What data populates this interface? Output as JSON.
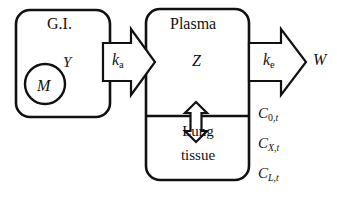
{
  "diagram": {
    "stroke_color": "#111111",
    "fill_color": "#ffffff",
    "compartments": [
      {
        "id": "gi",
        "name": "G.I. compartment",
        "label": "G.I.",
        "inner_circle_label": "M",
        "side_label": "Y"
      },
      {
        "id": "plasma",
        "name": "Plasma compartment",
        "label": "Plasma",
        "amount_label": "Z",
        "sub_label_line1": "Lung",
        "sub_label_line2": "tissue"
      }
    ],
    "flows": [
      {
        "id": "absorption",
        "name": "absorption-arrow",
        "label_base": "k",
        "label_sub": "a",
        "direction": "right"
      },
      {
        "id": "elimination",
        "name": "elimination-arrow",
        "label_base": "k",
        "label_sub": "e",
        "direction": "right",
        "output_label": "W"
      },
      {
        "id": "exchange",
        "name": "lung-exchange-arrow",
        "direction": "bidirectional-vertical"
      }
    ],
    "concentration_labels": [
      {
        "base": "C",
        "sub_first": "0",
        "sub_sep": ",",
        "sub_second": "t",
        "full": "C0,t"
      },
      {
        "base": "C",
        "sub_first": "X",
        "sub_sep": ",",
        "sub_second": "t",
        "full": "CX,t"
      },
      {
        "base": "C",
        "sub_first": "L",
        "sub_sep": ",",
        "sub_second": "t",
        "full": "CL,t"
      }
    ]
  }
}
